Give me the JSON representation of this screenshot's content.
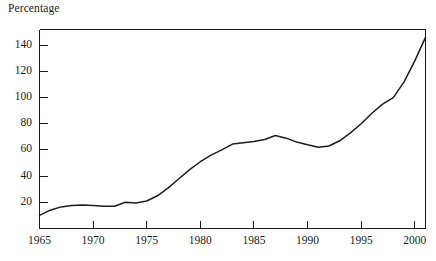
{
  "chart_data": {
    "type": "line",
    "title": "",
    "subtitle": "",
    "ylabel": "Percentage",
    "xlabel": "",
    "grid": false,
    "legend": "none",
    "xlim": [
      1965,
      2001
    ],
    "ylim": [
      0,
      152
    ],
    "y_ticks": [
      20,
      40,
      60,
      80,
      100,
      120,
      140
    ],
    "y_tick_labels": [
      "20",
      "40",
      "60",
      "80",
      "100",
      "120",
      "140"
    ],
    "x_ticks": [
      1965,
      1970,
      1975,
      1980,
      1985,
      1990,
      1995,
      2000
    ],
    "x_tick_labels": [
      "1965",
      "1970",
      "1975",
      "1980",
      "1985",
      "1990",
      "1995",
      "2000"
    ],
    "series": [
      {
        "name": "Percentage",
        "color": "#1d1d1d",
        "x": [
          1965,
          1966,
          1967,
          1968,
          1969,
          1970,
          1971,
          1972,
          1973,
          1974,
          1975,
          1976,
          1977,
          1978,
          1979,
          1980,
          1981,
          1982,
          1983,
          1984,
          1985,
          1986,
          1987,
          1988,
          1989,
          1990,
          1991,
          1992,
          1993,
          1994,
          1995,
          1996,
          1997,
          1998,
          1999,
          2000,
          2001
        ],
        "values": [
          10,
          14,
          16.5,
          17.5,
          18,
          17.5,
          17,
          17,
          20,
          19.5,
          21,
          25,
          31,
          38,
          45,
          51,
          56,
          60,
          64.5,
          65.5,
          66.5,
          68,
          71,
          69,
          66,
          64,
          62,
          63,
          67,
          73,
          80,
          88,
          95,
          100,
          112,
          128,
          146
        ]
      }
    ]
  }
}
